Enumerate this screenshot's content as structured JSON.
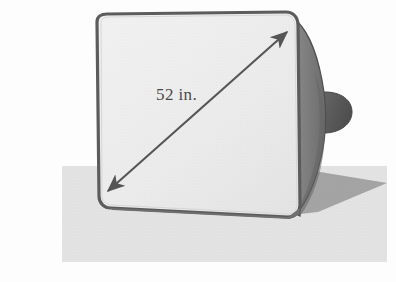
{
  "figure": {
    "measurement_label": "52 in.",
    "measurement_value": 52,
    "measurement_unit": "in.",
    "measurement_of": "screen-diagonal",
    "arrow_style": "double-headed",
    "arrow_from_corner": "bottom-left",
    "arrow_to_corner": "top-right"
  },
  "colors": {
    "page_background": "#fdfdfd",
    "ground_surface": "#e2e2e2",
    "cast_shadow": "#9d9d9d",
    "screen_face": "#eeeeee",
    "screen_face_edge": "#e6e6e6",
    "bezel_outline": "#5a5a5a",
    "cabinet_body": "#7d7d7d",
    "cabinet_body_dark": "#6a6a6a",
    "tube_neck": "#5f5f5f",
    "arrow_stroke": "#555555",
    "label_text": "#4a4a4a"
  },
  "geometry": {
    "ground_rect": {
      "x": 62,
      "y": 166,
      "width": 325,
      "height": 96
    },
    "screen_corners": {
      "top_left": [
        88,
        20
      ],
      "top_right": [
        297,
        15
      ],
      "bottom_right": [
        300,
        216
      ],
      "bottom_left": [
        100,
        204
      ]
    },
    "arrow_tip_start": [
      103,
      196
    ],
    "arrow_tip_end": [
      292,
      27
    ],
    "label_position": [
      156,
      98
    ]
  },
  "parts": [
    {
      "name": "screen-face",
      "description": "Light gray flat picture tube face"
    },
    {
      "name": "bezel",
      "description": "Dark rounded-rectangle frame around the screen"
    },
    {
      "name": "cabinet-body",
      "description": "Tapered dark gray casing receding to the right"
    },
    {
      "name": "tube-neck",
      "description": "Small rounded bulge at the rear of the cabinet"
    },
    {
      "name": "cast-shadow",
      "description": "Gray shadow cast to the right on the ground"
    },
    {
      "name": "ground-surface",
      "description": "Light gray rectangle representing the floor"
    },
    {
      "name": "diagonal-arrow",
      "description": "Double headed arrow across the screen diagonal"
    }
  ]
}
